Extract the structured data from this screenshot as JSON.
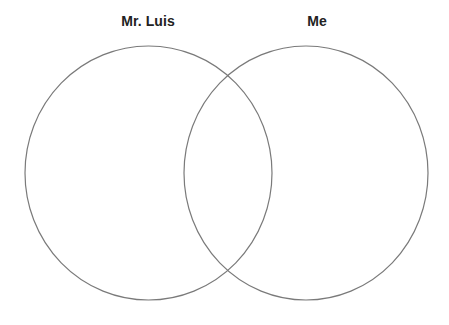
{
  "diagram": {
    "type": "venn",
    "sets": [
      {
        "id": "left",
        "label": "Mr. Luis"
      },
      {
        "id": "right",
        "label": "Me"
      }
    ],
    "colors": {
      "stroke": "#7a7a7a",
      "label": "#222222",
      "background": "#ffffff"
    }
  }
}
